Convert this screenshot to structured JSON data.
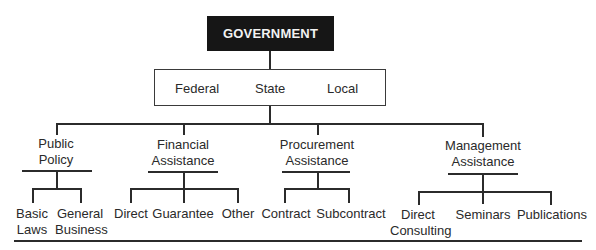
{
  "root": {
    "label": "GOVERNMENT"
  },
  "levels": {
    "federal": "Federal",
    "state": "State",
    "local": "Local"
  },
  "categories": [
    {
      "line1": "Public",
      "line2": "Policy",
      "children": [
        {
          "line1": "Basic",
          "line2": "Laws"
        },
        {
          "line1": "General",
          "line2": "Business"
        }
      ]
    },
    {
      "line1": "Financial",
      "line2": "Assistance",
      "children": [
        {
          "line1": "Direct"
        },
        {
          "line1": "Guarantee"
        },
        {
          "line1": "Other"
        }
      ]
    },
    {
      "line1": "Procurement",
      "line2": "Assistance",
      "children": [
        {
          "line1": "Contract"
        },
        {
          "line1": "Subcontract"
        }
      ]
    },
    {
      "line1": "Management",
      "line2": "Assistance",
      "children": [
        {
          "line1": "Direct",
          "line2": "Consulting"
        },
        {
          "line1": "Seminars"
        },
        {
          "line1": "Publications"
        }
      ]
    }
  ],
  "colors": {
    "root_bg": "#161616",
    "root_text": "#f2f2f2",
    "lines": "#2b2b2b"
  }
}
